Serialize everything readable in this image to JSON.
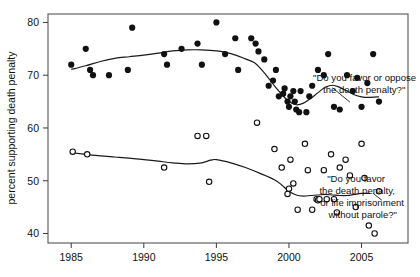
{
  "chart_data": {
    "type": "scatter",
    "title": "",
    "xlabel": "",
    "ylabel": "percent supporting death penalty",
    "xlim": [
      1983.4,
      2008.2
    ],
    "ylim": [
      38.2,
      81.6
    ],
    "xticks": [
      1985,
      1990,
      1995,
      2000,
      2005
    ],
    "xticklabels": [
      "1985",
      "1990",
      "1995",
      "2000",
      "2005"
    ],
    "yticks": [
      40,
      50,
      60,
      70,
      80
    ],
    "yticklabels": [
      "40",
      "50",
      "60",
      "70",
      "80"
    ],
    "grid": false,
    "legend_position": "inline-annotations",
    "series": [
      {
        "name": "\"Do you favor or oppose the death penalty?\"",
        "marker": "filled-circle",
        "annotation": {
          "line1": "\"Do you favor or oppose",
          "line2": "the death penalty?\""
        },
        "points": [
          [
            1985.0,
            72.0
          ],
          [
            1986.0,
            75.0
          ],
          [
            1986.3,
            71.0
          ],
          [
            1986.5,
            70.0
          ],
          [
            1987.6,
            70.0
          ],
          [
            1988.9,
            71.0
          ],
          [
            1989.2,
            79.0
          ],
          [
            1991.4,
            74.0
          ],
          [
            1991.6,
            72.0
          ],
          [
            1992.6,
            75.0
          ],
          [
            1993.7,
            76.0
          ],
          [
            1994.0,
            72.0
          ],
          [
            1995.0,
            80.0
          ],
          [
            1995.6,
            74.0
          ],
          [
            1996.3,
            77.0
          ],
          [
            1996.5,
            71.0
          ],
          [
            1997.4,
            77.0
          ],
          [
            1997.7,
            76.0
          ],
          [
            1997.9,
            74.5
          ],
          [
            1998.3,
            73.0
          ],
          [
            1998.6,
            68.0
          ],
          [
            1998.9,
            69.0
          ],
          [
            1999.1,
            71.0
          ],
          [
            1999.3,
            66.0
          ],
          [
            1999.6,
            66.5
          ],
          [
            1999.7,
            67.5
          ],
          [
            1999.9,
            65.0
          ],
          [
            2000.0,
            64.0
          ],
          [
            2000.1,
            66.0
          ],
          [
            2000.3,
            67.0
          ],
          [
            2000.4,
            65.0
          ],
          [
            2000.5,
            63.5
          ],
          [
            2000.7,
            63.0
          ],
          [
            2000.8,
            67.0
          ],
          [
            2001.2,
            63.0
          ],
          [
            2001.4,
            66.0
          ],
          [
            2001.6,
            68.0
          ],
          [
            2002.0,
            71.0
          ],
          [
            2002.4,
            70.0
          ],
          [
            2002.7,
            74.0
          ],
          [
            2003.1,
            64.0
          ],
          [
            2003.5,
            63.5
          ],
          [
            2004.0,
            70.0
          ],
          [
            2004.4,
            67.0
          ],
          [
            2004.7,
            69.5
          ],
          [
            2005.0,
            64.0
          ],
          [
            2005.4,
            68.5
          ],
          [
            2005.8,
            74.0
          ],
          [
            2006.2,
            65.0
          ]
        ]
      },
      {
        "name": "\"Do you favor the death penalty, or life imprisonment without parole?\"",
        "marker": "open-circle",
        "annotation": {
          "line1": "\"Do you favor",
          "line2": "the death penalty,",
          "line3": "or life imprisonment",
          "line4": "without parole?\""
        },
        "points": [
          [
            1985.1,
            55.5
          ],
          [
            1986.1,
            55.0
          ],
          [
            1991.4,
            52.5
          ],
          [
            1993.7,
            58.5
          ],
          [
            1994.3,
            58.5
          ],
          [
            1994.5,
            49.8
          ],
          [
            1997.8,
            61.0
          ],
          [
            1999.0,
            56.0
          ],
          [
            1999.5,
            52.5
          ],
          [
            1999.9,
            47.5
          ],
          [
            2000.0,
            48.5
          ],
          [
            2000.1,
            54.0
          ],
          [
            2000.3,
            49.5
          ],
          [
            2000.6,
            44.5
          ],
          [
            2001.1,
            57.0
          ],
          [
            2001.3,
            52.0
          ],
          [
            2001.6,
            44.5
          ],
          [
            2001.9,
            46.5
          ],
          [
            2002.0,
            46.3
          ],
          [
            2002.1,
            46.5
          ],
          [
            2002.4,
            52.0
          ],
          [
            2002.6,
            46.5
          ],
          [
            2002.9,
            55.0
          ],
          [
            2003.1,
            46.5
          ],
          [
            2003.3,
            44.0
          ],
          [
            2003.5,
            52.5
          ],
          [
            2003.9,
            54.0
          ],
          [
            2004.2,
            51.0
          ],
          [
            2004.6,
            45.0
          ],
          [
            2005.0,
            57.0
          ],
          [
            2005.2,
            50.5
          ],
          [
            2005.5,
            41.5
          ],
          [
            2005.9,
            40.0
          ],
          [
            2006.2,
            48.0
          ]
        ]
      }
    ],
    "trend_lines": [
      {
        "series": 0,
        "points": [
          [
            1985.0,
            71.1
          ],
          [
            1986.0,
            71.8
          ],
          [
            1987.0,
            72.6
          ],
          [
            1988.0,
            73.2
          ],
          [
            1989.0,
            73.5
          ],
          [
            1990.0,
            73.8
          ],
          [
            1991.0,
            74.2
          ],
          [
            1992.0,
            74.6
          ],
          [
            1993.0,
            74.8
          ],
          [
            1994.0,
            74.8
          ],
          [
            1995.0,
            74.6
          ],
          [
            1996.0,
            74.1
          ],
          [
            1997.0,
            73.1
          ],
          [
            1997.6,
            72.4
          ],
          [
            1998.0,
            71.4
          ],
          [
            1998.5,
            69.8
          ],
          [
            1999.0,
            68.0
          ],
          [
            1999.5,
            66.4
          ],
          [
            2000.0,
            65.0
          ],
          [
            2000.5,
            64.4
          ],
          [
            2001.0,
            64.7
          ],
          [
            2001.5,
            65.6
          ],
          [
            2002.0,
            66.7
          ],
          [
            2002.5,
            67.7
          ],
          [
            2003.0,
            68.1
          ],
          [
            2003.5,
            67.7
          ],
          [
            2004.0,
            67.0
          ],
          [
            2004.5,
            66.3
          ],
          [
            2005.0,
            65.9
          ],
          [
            2005.5,
            65.8
          ],
          [
            2006.2,
            65.9
          ]
        ]
      },
      {
        "series": 1,
        "points": [
          [
            1985.1,
            55.3
          ],
          [
            1986.0,
            55.0
          ],
          [
            1987.0,
            54.7
          ],
          [
            1988.0,
            54.5
          ],
          [
            1989.0,
            54.3
          ],
          [
            1990.0,
            54.0
          ],
          [
            1991.0,
            53.7
          ],
          [
            1992.0,
            53.4
          ],
          [
            1993.0,
            53.2
          ],
          [
            1994.0,
            53.4
          ],
          [
            1994.6,
            53.9
          ],
          [
            1995.0,
            54.0
          ],
          [
            1996.0,
            53.4
          ],
          [
            1997.0,
            52.5
          ],
          [
            1998.0,
            51.4
          ],
          [
            1999.0,
            50.2
          ],
          [
            1999.5,
            49.2
          ],
          [
            2000.0,
            48.0
          ],
          [
            2000.5,
            47.3
          ],
          [
            2001.0,
            47.1
          ],
          [
            2001.5,
            47.2
          ],
          [
            2002.0,
            47.3
          ],
          [
            2002.5,
            47.4
          ],
          [
            2003.0,
            47.3
          ],
          [
            2003.5,
            47.2
          ],
          [
            2004.0,
            47.2
          ],
          [
            2004.5,
            47.4
          ],
          [
            2005.0,
            47.6
          ],
          [
            2005.6,
            47.6
          ]
        ]
      }
    ],
    "leaders": [
      {
        "from": [
          2003.0,
          67.6
        ],
        "to": [
          2004.2,
          64.9
        ],
        "for": "annotation-death-penalty"
      },
      {
        "from": [
          2005.8,
          47.6
        ],
        "to": [
          2006.4,
          46.3
        ],
        "for": "annotation-life-imprisonment"
      }
    ]
  }
}
